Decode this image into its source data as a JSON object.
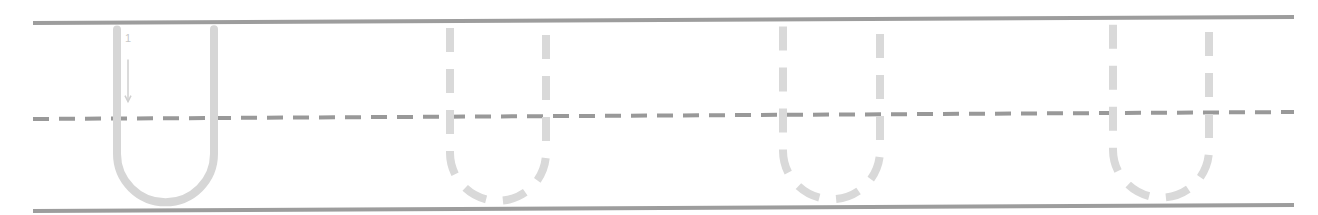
{
  "worksheet": {
    "type": "handwriting-practice",
    "letter": "U",
    "stroke_order_label": "1",
    "colors": {
      "background": "#ffffff",
      "guide_line": "#9d9d9d",
      "midline_dash": "#999999",
      "model_letter": "#d6d6d6",
      "trace_letter": "#d9d9d9",
      "arrow": "#cfcfcf"
    },
    "guide_lines": {
      "x_start": 33,
      "x_end": 1294,
      "top": {
        "y_left": 23,
        "y_right": 17
      },
      "midline": {
        "y_left": 119,
        "y_right": 112,
        "dash": 16,
        "gap": 10
      },
      "bottom": {
        "y_left": 211,
        "y_right": 205
      }
    },
    "letters": [
      {
        "id": "model",
        "style": "solid",
        "left_x": 117,
        "right_x": 214,
        "with_arrow": true
      },
      {
        "id": "trace-1",
        "style": "dashed",
        "left_x": 450,
        "right_x": 546,
        "with_arrow": false
      },
      {
        "id": "trace-2",
        "style": "dashed",
        "left_x": 783,
        "right_x": 880,
        "with_arrow": false
      },
      {
        "id": "trace-3",
        "style": "dashed",
        "left_x": 1113,
        "right_x": 1209,
        "with_arrow": false
      }
    ]
  }
}
